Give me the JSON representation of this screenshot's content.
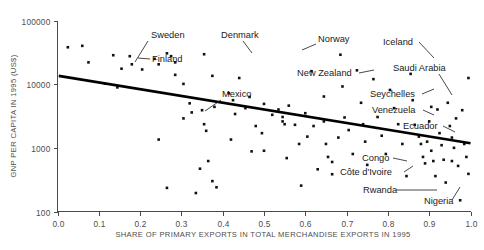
{
  "chart_data": {
    "type": "scatter",
    "title": "",
    "xlabel": "SHARE OF PRIMARY EXPORTS IN TOTAL MERCHANDISE EXPORTS IN 1995",
    "ylabel": "GNP PER CAPITA IN 1995 (US$)",
    "xlim": [
      0.0,
      1.0
    ],
    "ylim": [
      100,
      100000
    ],
    "yscale": "log",
    "xscale": "linear",
    "grid": false,
    "legend": "none",
    "xticks": [
      "0.0",
      "0.1",
      "0.2",
      "0.3",
      "0.4",
      "0.5",
      "0.6",
      "0.7",
      "0.8",
      "0.9",
      "1.0"
    ],
    "xtick_values": [
      0.0,
      0.1,
      0.2,
      0.3,
      0.4,
      0.5,
      0.6,
      0.7,
      0.8,
      0.9,
      1.0
    ],
    "yticks": [
      "100000",
      "10000",
      "1000",
      "100"
    ],
    "ytick_values": [
      100000,
      10000,
      1000,
      100
    ],
    "trendline": {
      "name": "fitted regression line",
      "x": [
        0.003,
        1.0
      ],
      "y": [
        13500,
        1180
      ]
    },
    "points": [
      {
        "x": 0.025,
        "y": 38000
      },
      {
        "x": 0.06,
        "y": 40000
      },
      {
        "x": 0.075,
        "y": 22000
      },
      {
        "x": 0.135,
        "y": 28500
      },
      {
        "x": 0.155,
        "y": 17500
      },
      {
        "x": 0.175,
        "y": 27500
      },
      {
        "x": 0.18,
        "y": 20500
      },
      {
        "x": 0.115,
        "y": 10200
      },
      {
        "x": 0.145,
        "y": 8900
      },
      {
        "x": 0.205,
        "y": 17000
      },
      {
        "x": 0.235,
        "y": 25000
      },
      {
        "x": 0.245,
        "y": 20500
      },
      {
        "x": 0.265,
        "y": 30500
      },
      {
        "x": 0.275,
        "y": 27500
      },
      {
        "x": 0.285,
        "y": 22000
      },
      {
        "x": 0.285,
        "y": 14000
      },
      {
        "x": 0.305,
        "y": 10100
      },
      {
        "x": 0.32,
        "y": 5000
      },
      {
        "x": 0.35,
        "y": 3900
      },
      {
        "x": 0.355,
        "y": 29500
      },
      {
        "x": 0.375,
        "y": 13500
      },
      {
        "x": 0.38,
        "y": 4400
      },
      {
        "x": 0.245,
        "y": 1350
      },
      {
        "x": 0.265,
        "y": 235
      },
      {
        "x": 0.305,
        "y": 2900
      },
      {
        "x": 0.325,
        "y": 3600
      },
      {
        "x": 0.335,
        "y": 195
      },
      {
        "x": 0.345,
        "y": 470
      },
      {
        "x": 0.355,
        "y": 2350
      },
      {
        "x": 0.36,
        "y": 1850
      },
      {
        "x": 0.365,
        "y": 620
      },
      {
        "x": 0.375,
        "y": 300
      },
      {
        "x": 0.385,
        "y": 240
      },
      {
        "x": 0.42,
        "y": 1350
      },
      {
        "x": 0.415,
        "y": 7200
      },
      {
        "x": 0.425,
        "y": 5600
      },
      {
        "x": 0.44,
        "y": 12500
      },
      {
        "x": 0.455,
        "y": 4200
      },
      {
        "x": 0.465,
        "y": 6300
      },
      {
        "x": 0.48,
        "y": 2200
      },
      {
        "x": 0.495,
        "y": 1700
      },
      {
        "x": 0.5,
        "y": 900
      },
      {
        "x": 0.52,
        "y": 3300
      },
      {
        "x": 0.535,
        "y": 4000
      },
      {
        "x": 0.545,
        "y": 3050
      },
      {
        "x": 0.545,
        "y": 2600
      },
      {
        "x": 0.55,
        "y": 2350
      },
      {
        "x": 0.555,
        "y": 690
      },
      {
        "x": 0.575,
        "y": 2300
      },
      {
        "x": 0.585,
        "y": 1150
      },
      {
        "x": 0.59,
        "y": 255
      },
      {
        "x": 0.605,
        "y": 1500
      },
      {
        "x": 0.615,
        "y": 16000
      },
      {
        "x": 0.62,
        "y": 2200
      },
      {
        "x": 0.63,
        "y": 460
      },
      {
        "x": 0.645,
        "y": 6400
      },
      {
        "x": 0.645,
        "y": 2600
      },
      {
        "x": 0.65,
        "y": 1150
      },
      {
        "x": 0.655,
        "y": 720
      },
      {
        "x": 0.665,
        "y": 600
      },
      {
        "x": 0.665,
        "y": 385
      },
      {
        "x": 0.685,
        "y": 29000
      },
      {
        "x": 0.69,
        "y": 9200
      },
      {
        "x": 0.695,
        "y": 3000
      },
      {
        "x": 0.705,
        "y": 1900
      },
      {
        "x": 0.715,
        "y": 800
      },
      {
        "x": 0.725,
        "y": 16500
      },
      {
        "x": 0.735,
        "y": 5100
      },
      {
        "x": 0.74,
        "y": 2350
      },
      {
        "x": 0.745,
        "y": 1250
      },
      {
        "x": 0.75,
        "y": 540
      },
      {
        "x": 0.765,
        "y": 12000
      },
      {
        "x": 0.775,
        "y": 3050
      },
      {
        "x": 0.785,
        "y": 1550
      },
      {
        "x": 0.795,
        "y": 800
      },
      {
        "x": 0.805,
        "y": 8100
      },
      {
        "x": 0.815,
        "y": 4200
      },
      {
        "x": 0.825,
        "y": 2350
      },
      {
        "x": 0.835,
        "y": 1150
      },
      {
        "x": 0.845,
        "y": 360
      },
      {
        "x": 0.855,
        "y": 14500
      },
      {
        "x": 0.86,
        "y": 5600
      },
      {
        "x": 0.865,
        "y": 2300
      },
      {
        "x": 0.875,
        "y": 1500
      },
      {
        "x": 0.88,
        "y": 1150
      },
      {
        "x": 0.885,
        "y": 720
      },
      {
        "x": 0.89,
        "y": 570
      },
      {
        "x": 0.895,
        "y": 1250
      },
      {
        "x": 0.9,
        "y": 2600
      },
      {
        "x": 0.905,
        "y": 4400
      },
      {
        "x": 0.905,
        "y": 900
      },
      {
        "x": 0.91,
        "y": 620
      },
      {
        "x": 0.915,
        "y": 360
      },
      {
        "x": 0.92,
        "y": 4000
      },
      {
        "x": 0.925,
        "y": 1700
      },
      {
        "x": 0.93,
        "y": 1100
      },
      {
        "x": 0.935,
        "y": 650
      },
      {
        "x": 0.94,
        "y": 285
      },
      {
        "x": 0.945,
        "y": 5100
      },
      {
        "x": 0.95,
        "y": 2200
      },
      {
        "x": 0.955,
        "y": 1450
      },
      {
        "x": 0.955,
        "y": 620
      },
      {
        "x": 0.96,
        "y": 1000
      },
      {
        "x": 0.965,
        "y": 2900
      },
      {
        "x": 0.97,
        "y": 520
      },
      {
        "x": 0.975,
        "y": 150
      },
      {
        "x": 0.98,
        "y": 3900
      },
      {
        "x": 0.985,
        "y": 1150
      },
      {
        "x": 0.99,
        "y": 720
      },
      {
        "x": 0.995,
        "y": 390
      },
      {
        "x": 0.995,
        "y": 12500
      },
      {
        "x": 0.5,
        "y": 4900
      },
      {
        "x": 0.43,
        "y": 3400
      },
      {
        "x": 0.47,
        "y": 880
      },
      {
        "x": 0.56,
        "y": 4600
      },
      {
        "x": 0.6,
        "y": 3500
      },
      {
        "x": 0.68,
        "y": 1450
      }
    ],
    "annotations": [
      {
        "label": "Sweden",
        "tx": 151,
        "ty": 38,
        "anchor": "start",
        "lx1": 148,
        "ly1": 41,
        "lx2": 135,
        "ly2": 62
      },
      {
        "label": "Finland",
        "tx": 152,
        "ty": 62,
        "anchor": "start",
        "lx1": 150,
        "ly1": 59,
        "lx2": 138,
        "ly2": 58
      },
      {
        "label": "Denmark",
        "tx": 221,
        "ty": 38,
        "anchor": "start",
        "lx1": 243,
        "ly1": 41,
        "lx2": 252,
        "ly2": 53
      },
      {
        "label": "Norway",
        "tx": 318,
        "ty": 42,
        "anchor": "start",
        "lx1": 316,
        "ly1": 44,
        "lx2": 302,
        "ly2": 50
      },
      {
        "label": "Iceland",
        "tx": 383,
        "ty": 45,
        "anchor": "start",
        "lx1": 419,
        "ly1": 42,
        "lx2": 434,
        "ly2": 58
      },
      {
        "label": "New Zealand",
        "tx": 297,
        "ty": 76,
        "anchor": "start",
        "lx1": 359,
        "ly1": 73,
        "lx2": 374,
        "ly2": 70
      },
      {
        "label": "Saudi Arabia",
        "tx": 393,
        "ty": 71,
        "anchor": "start",
        "lx1": 439,
        "ly1": 74,
        "lx2": 452,
        "ly2": 95
      },
      {
        "label": "Seychelles",
        "tx": 370,
        "ty": 97,
        "anchor": "start",
        "lx1": 422,
        "ly1": 94,
        "lx2": 434,
        "ly2": 89
      },
      {
        "label": "Venezuela",
        "tx": 372,
        "ty": 113,
        "anchor": "start",
        "lx1": 423,
        "ly1": 110,
        "lx2": 434,
        "ly2": 115
      },
      {
        "label": "Ecuador",
        "tx": 403,
        "ty": 129,
        "anchor": "start",
        "lx1": 443,
        "ly1": 126,
        "lx2": 455,
        "ly2": 132
      },
      {
        "label": "Mexico",
        "tx": 222,
        "ty": 97,
        "anchor": "start",
        "lx1": 221,
        "ly1": 100,
        "lx2": 205,
        "ly2": 111
      },
      {
        "label": "Congo",
        "tx": 362,
        "ty": 161,
        "anchor": "start",
        "lx1": 393,
        "ly1": 158,
        "lx2": 407,
        "ly2": 161
      },
      {
        "label": "Côte d'Ivoire",
        "tx": 340,
        "ty": 175,
        "anchor": "start",
        "lx1": 404,
        "ly1": 172,
        "lx2": 413,
        "ly2": 166
      },
      {
        "label": "Rwanda",
        "tx": 363,
        "ty": 193,
        "anchor": "start",
        "lx1": 396,
        "ly1": 190,
        "lx2": 437,
        "ly2": 190
      },
      {
        "label": "Nigeria",
        "tx": 424,
        "ty": 204,
        "anchor": "start",
        "lx1": 452,
        "ly1": 200,
        "lx2": 460,
        "ly2": 187
      }
    ]
  },
  "axes": {
    "x_title": "SHARE OF PRIMARY EXPORTS IN TOTAL MERCHANDISE EXPORTS IN 1995",
    "y_title": "GNP PER CAPITA IN 1995 (US$)"
  }
}
